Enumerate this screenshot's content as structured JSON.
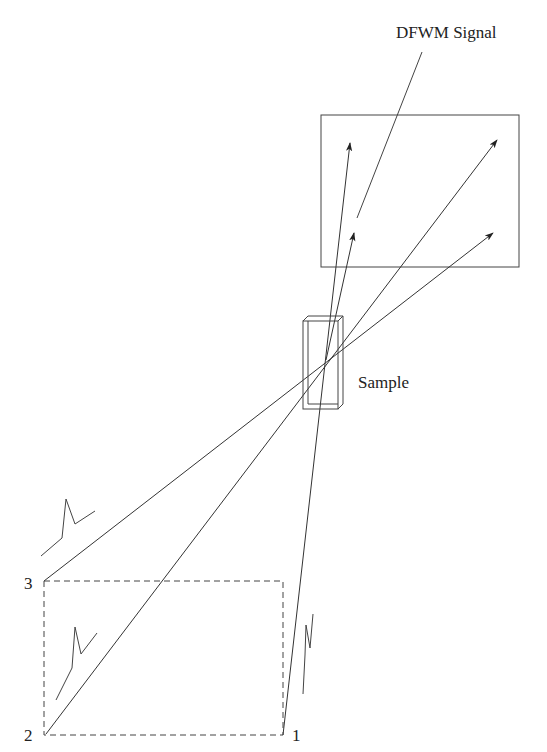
{
  "diagram": {
    "colors": {
      "line": "#333333",
      "background": "#ffffff",
      "text": "#222222"
    },
    "labels": {
      "signal": "DFWM Signal",
      "sample": "Sample",
      "beam1": "1",
      "beam2": "2",
      "beam3": "3"
    },
    "elements": {
      "detector_box": {
        "x": 321,
        "y": 115,
        "w": 198,
        "h": 152
      },
      "sample_cell": {
        "x": 303,
        "y": 316,
        "w": 40,
        "h": 93
      },
      "input_plane_dashed": {
        "x": 44,
        "y": 581,
        "w": 239,
        "h": 154
      },
      "crossing_point": {
        "x": 326,
        "y": 360
      }
    },
    "beams": [
      {
        "name": "beam-1",
        "from": [
          283,
          735
        ],
        "to": [
          350,
          143
        ]
      },
      {
        "name": "beam-2",
        "from": [
          46,
          734
        ],
        "to": [
          497,
          140
        ]
      },
      {
        "name": "beam-3",
        "from": [
          44,
          581
        ],
        "to": [
          493,
          233
        ]
      },
      {
        "name": "dfwm-signal",
        "from": [
          326,
          360
        ],
        "to": [
          354,
          233
        ]
      }
    ]
  }
}
